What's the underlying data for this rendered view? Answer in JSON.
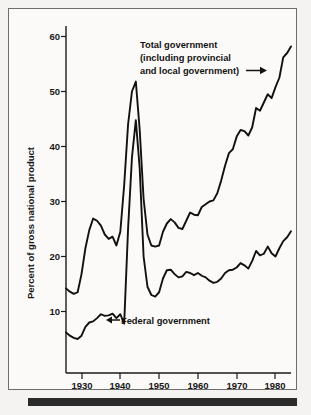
{
  "figure": {
    "background_color": "#f4f3f1",
    "panel_color": "#fbfaf8",
    "frame_color": "#6d6d6d",
    "ink_color": "#111111",
    "bottom_rule_color": "#2b2b2b"
  },
  "axes": {
    "ylabel": "Percent of gross national product",
    "y_ticks": [
      "10",
      "20",
      "30",
      "40",
      "50",
      "60"
    ],
    "x_ticks": [
      "1930",
      "1940",
      "1950",
      "1960",
      "1970",
      "1980"
    ]
  },
  "annotations": {
    "total": {
      "line1": "Total government",
      "line2": "(including provincial",
      "line3": "and local government)",
      "arrow": "arrow-right"
    },
    "federal": {
      "label": "Federal government",
      "arrow": "arrow-left"
    }
  },
  "chart_data": {
    "type": "line",
    "title": "",
    "xlabel": "",
    "ylabel": "Percent of gross national product",
    "xlim": [
      1926,
      1984
    ],
    "ylim": [
      0,
      62
    ],
    "y_ticks": [
      10,
      20,
      30,
      40,
      50,
      60
    ],
    "x_ticks": [
      1930,
      1940,
      1950,
      1960,
      1970,
      1980
    ],
    "grid": false,
    "legend": "annotated-inline",
    "series": [
      {
        "name": "Total government (including provincial and local government)",
        "x": [
          1926,
          1927,
          1928,
          1929,
          1930,
          1931,
          1932,
          1933,
          1934,
          1935,
          1936,
          1937,
          1938,
          1939,
          1940,
          1941,
          1942,
          1943,
          1944,
          1945,
          1946,
          1947,
          1948,
          1949,
          1950,
          1951,
          1952,
          1953,
          1954,
          1955,
          1956,
          1957,
          1958,
          1959,
          1960,
          1961,
          1962,
          1963,
          1964,
          1965,
          1966,
          1967,
          1968,
          1969,
          1970,
          1971,
          1972,
          1973,
          1974,
          1975,
          1976,
          1977,
          1978,
          1979,
          1980,
          1981,
          1982,
          1983,
          1984
        ],
        "y": [
          14.2,
          13.6,
          13.2,
          13.5,
          16.8,
          21.5,
          24.8,
          26.9,
          26.5,
          25.6,
          24.0,
          23.2,
          23.6,
          22.0,
          24.5,
          33.0,
          44.0,
          50.0,
          51.8,
          43.0,
          30.5,
          24.0,
          22.0,
          21.8,
          22.0,
          24.5,
          26.0,
          26.8,
          26.2,
          25.2,
          25.0,
          26.5,
          28.0,
          27.6,
          27.5,
          29.0,
          29.5,
          30.0,
          30.2,
          31.5,
          33.8,
          36.5,
          38.8,
          39.5,
          41.8,
          43.0,
          42.8,
          42.0,
          43.5,
          47.0,
          46.5,
          48.0,
          49.5,
          48.8,
          50.8,
          52.5,
          56.2,
          57.0,
          58.2
        ]
      },
      {
        "name": "Federal government",
        "x": [
          1926,
          1927,
          1928,
          1929,
          1930,
          1931,
          1932,
          1933,
          1934,
          1935,
          1936,
          1937,
          1938,
          1939,
          1940,
          1941,
          1942,
          1943,
          1944,
          1945,
          1946,
          1947,
          1948,
          1949,
          1950,
          1951,
          1952,
          1953,
          1954,
          1955,
          1956,
          1957,
          1958,
          1959,
          1960,
          1961,
          1962,
          1963,
          1964,
          1965,
          1966,
          1967,
          1968,
          1969,
          1970,
          1971,
          1972,
          1973,
          1974,
          1975,
          1976,
          1977,
          1978,
          1979,
          1980,
          1981,
          1982,
          1983,
          1984
        ],
        "y": [
          6.2,
          5.6,
          5.2,
          5.0,
          5.6,
          7.2,
          8.0,
          8.2,
          8.8,
          9.5,
          9.2,
          9.3,
          9.6,
          8.8,
          9.5,
          7.8,
          25.0,
          38.0,
          44.8,
          36.0,
          20.0,
          14.5,
          13.0,
          12.7,
          13.5,
          16.0,
          17.5,
          17.6,
          16.8,
          16.2,
          16.4,
          17.2,
          17.0,
          16.6,
          17.0,
          16.5,
          16.2,
          15.6,
          15.2,
          15.4,
          16.0,
          17.0,
          17.5,
          17.6,
          18.0,
          18.8,
          18.4,
          17.8,
          19.2,
          21.0,
          20.2,
          20.5,
          21.8,
          20.6,
          20.0,
          21.5,
          22.8,
          23.5,
          24.6
        ]
      }
    ]
  }
}
